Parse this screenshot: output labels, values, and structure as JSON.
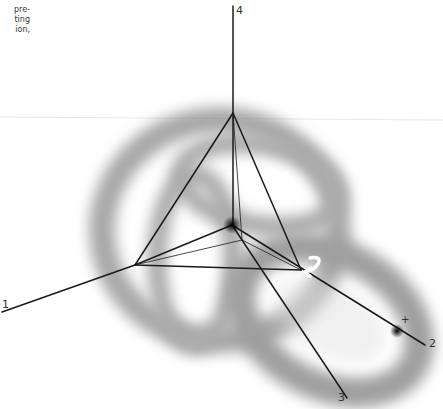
{
  "caption_fragment": {
    "lines": [
      "pre-",
      "ting",
      "ion,"
    ]
  },
  "diagram": {
    "type": "tetrahedral coordinate frame over blurred torus-like surfaces",
    "axes": [
      {
        "id": "axis-1",
        "label": "1"
      },
      {
        "id": "axis-2",
        "label": "2"
      },
      {
        "id": "axis-3",
        "label": "3"
      },
      {
        "id": "axis-4",
        "label": "4"
      }
    ],
    "marker": {
      "label": "+"
    },
    "rotation_arrows": 3,
    "colors": {
      "background": "#ffffff",
      "lines": "#1a1a1a",
      "surface_shadow": "#8a8a8a",
      "arrows": "#ffffff",
      "text": "#333333"
    }
  }
}
